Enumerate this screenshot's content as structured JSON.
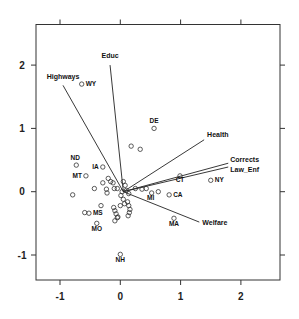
{
  "chart_data": {
    "type": "scatter",
    "subtype": "biplot",
    "title": "",
    "xlabel": "",
    "ylabel": "",
    "xlim": [
      -1.4,
      2.65
    ],
    "ylim": [
      -1.4,
      2.64
    ],
    "x_ticks": [
      -1,
      0,
      1,
      2
    ],
    "y_ticks": [
      -1,
      0,
      1,
      2
    ],
    "x_tick_labels": [
      "-1",
      "0",
      "1",
      "2"
    ],
    "y_tick_labels": [
      "-1",
      "0",
      "1",
      "2"
    ],
    "grid": false,
    "legend": null,
    "arrow_origin": [
      0.05,
      0.0
    ],
    "variables": [
      {
        "name": "Educ",
        "x": -0.17,
        "y": 2.0
      },
      {
        "name": "Highways",
        "x": -0.95,
        "y": 1.68
      },
      {
        "name": "Health",
        "x": 1.39,
        "y": 0.82
      },
      {
        "name": "Corrects",
        "x": 1.79,
        "y": 0.45
      },
      {
        "name": "Law_Enf",
        "x": 1.79,
        "y": 0.39
      },
      {
        "name": "Welfare",
        "x": 1.31,
        "y": -0.48
      }
    ],
    "labeled_points": [
      {
        "label": "WY",
        "x": -0.64,
        "y": 1.7
      },
      {
        "label": "DE",
        "x": 0.56,
        "y": 1.0
      },
      {
        "label": "ND",
        "x": -0.73,
        "y": 0.42
      },
      {
        "label": "IA",
        "x": -0.29,
        "y": 0.39
      },
      {
        "label": "MT",
        "x": -0.57,
        "y": 0.25
      },
      {
        "label": "CT",
        "x": 0.99,
        "y": 0.25
      },
      {
        "label": "NY",
        "x": 1.5,
        "y": 0.18
      },
      {
        "label": "CA",
        "x": 0.81,
        "y": -0.05
      },
      {
        "label": "MI",
        "x": 0.52,
        "y": -0.02
      },
      {
        "label": "MA",
        "x": 0.89,
        "y": -0.42
      },
      {
        "label": "MS",
        "x": -0.52,
        "y": -0.34
      },
      {
        "label": "MO",
        "x": -0.39,
        "y": -0.5
      },
      {
        "label": "NH",
        "x": 0.0,
        "y": -0.99
      }
    ],
    "unlabeled_points": [
      [
        0.18,
        0.72
      ],
      [
        0.33,
        0.67
      ],
      [
        -0.43,
        0.05
      ],
      [
        -0.79,
        -0.05
      ],
      [
        -0.59,
        -0.33
      ],
      [
        -0.2,
        0.21
      ],
      [
        -0.16,
        0.16
      ],
      [
        -0.12,
        0.14
      ],
      [
        -0.29,
        0.14
      ],
      [
        -0.23,
        0.04
      ],
      [
        -0.22,
        -0.02
      ],
      [
        -0.1,
        0.05
      ],
      [
        -0.05,
        0.05
      ],
      [
        0.05,
        0.16
      ],
      [
        0.08,
        0.1
      ],
      [
        0.03,
        0.0
      ],
      [
        0.1,
        0.02
      ],
      [
        0.14,
        -0.03
      ],
      [
        0.25,
        0.05
      ],
      [
        0.36,
        0.04
      ],
      [
        0.43,
        0.05
      ],
      [
        0.63,
        0.0
      ],
      [
        -0.32,
        -0.22
      ],
      [
        -0.11,
        -0.25
      ],
      [
        -0.09,
        -0.3
      ],
      [
        -0.07,
        -0.35
      ],
      [
        -0.04,
        -0.4
      ],
      [
        -0.09,
        -0.46
      ],
      [
        -0.05,
        -0.41
      ],
      [
        0.0,
        -0.22
      ],
      [
        0.07,
        -0.19
      ],
      [
        0.12,
        -0.16
      ],
      [
        0.14,
        -0.22
      ],
      [
        0.15,
        -0.33
      ],
      [
        0.13,
        -0.38
      ],
      [
        0.16,
        -0.28
      ],
      [
        0.05,
        -0.12
      ],
      [
        0.01,
        -0.06
      ]
    ]
  },
  "axes": {
    "bottom": [
      "-1",
      "0",
      "1",
      "2"
    ],
    "left": [
      "-1",
      "0",
      "1",
      "2"
    ]
  }
}
